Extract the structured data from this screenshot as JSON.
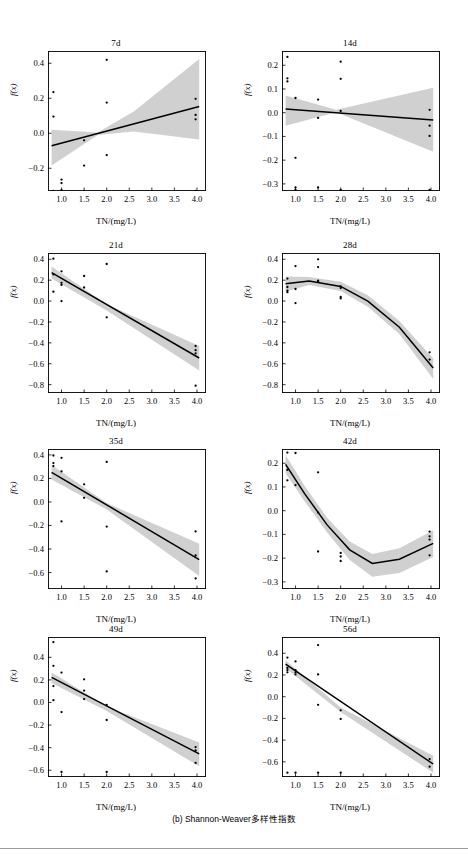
{
  "figure": {
    "caption": "(b) Shannon-Weaver多样性指数",
    "x_axis_label": "TN/(mg/L)",
    "y_axis_label": "f(x)"
  },
  "chart_data": [
    {
      "type": "scatter",
      "title": "7d",
      "xlabel": "TN/(mg/L)",
      "ylabel": "f(x)",
      "xlim": [
        0.7,
        4.2
      ],
      "ylim": [
        -0.33,
        0.47
      ],
      "xticks": [
        "1.0",
        "1.5",
        "2.0",
        "2.5",
        "3.0",
        "3.5",
        "4.0"
      ],
      "xtickvals": [
        1.0,
        1.5,
        2.0,
        2.5,
        3.0,
        3.5,
        4.0
      ],
      "yticks": [
        "0.4",
        "0.2",
        "0.0",
        "-0.2"
      ],
      "ytickvals": [
        0.4,
        0.2,
        0.0,
        -0.2
      ],
      "grid": false,
      "legend": "none",
      "points": [
        [
          0.82,
          0.235
        ],
        [
          0.82,
          0.095
        ],
        [
          0.82,
          -0.33
        ],
        [
          1.0,
          -0.265
        ],
        [
          1.0,
          -0.285
        ],
        [
          1.0,
          -0.325
        ],
        [
          1.0,
          -0.335
        ],
        [
          1.5,
          -0.04
        ],
        [
          1.5,
          -0.185
        ],
        [
          1.5,
          -0.33
        ],
        [
          2.0,
          0.42
        ],
        [
          2.0,
          0.175
        ],
        [
          2.0,
          -0.125
        ],
        [
          2.0,
          -0.33
        ],
        [
          3.97,
          0.197
        ],
        [
          3.97,
          0.105
        ],
        [
          3.97,
          0.08
        ],
        [
          3.97,
          -0.33
        ]
      ],
      "fit": [
        [
          0.78,
          -0.072
        ],
        [
          4.05,
          0.153
        ]
      ],
      "band_upper": [
        [
          0.78,
          0.02
        ],
        [
          1.8,
          0.005
        ],
        [
          2.6,
          0.125
        ],
        [
          4.05,
          0.425
        ]
      ],
      "band_lower": [
        [
          0.78,
          -0.185
        ],
        [
          1.8,
          -0.01
        ],
        [
          2.6,
          0.01
        ],
        [
          4.05,
          -0.035
        ]
      ]
    },
    {
      "type": "scatter",
      "title": "14d",
      "xlabel": "TN/(mg/L)",
      "ylabel": "f(x)",
      "xlim": [
        0.7,
        4.2
      ],
      "ylim": [
        -0.33,
        0.26
      ],
      "xticks": [
        "1.0",
        "1.5",
        "2.0",
        "2.5",
        "3.0",
        "3.5",
        "4.0"
      ],
      "xtickvals": [
        1.0,
        1.5,
        2.0,
        2.5,
        3.0,
        3.5,
        4.0
      ],
      "yticks": [
        "0.2",
        "0.1",
        "0.0",
        "-0.1",
        "-0.2",
        "-0.3"
      ],
      "ytickvals": [
        0.2,
        0.1,
        0.0,
        -0.1,
        -0.2,
        -0.3
      ],
      "grid": false,
      "legend": "none",
      "points": [
        [
          0.82,
          0.235
        ],
        [
          0.82,
          0.145
        ],
        [
          0.82,
          0.132
        ],
        [
          1.0,
          0.062
        ],
        [
          1.0,
          -0.19
        ],
        [
          1.0,
          -0.315
        ],
        [
          1.0,
          -0.325
        ],
        [
          1.5,
          0.055
        ],
        [
          1.5,
          -0.022
        ],
        [
          1.5,
          -0.315
        ],
        [
          2.0,
          0.215
        ],
        [
          2.0,
          0.143
        ],
        [
          2.0,
          0.007
        ],
        [
          2.0,
          -0.325
        ],
        [
          3.97,
          0.012
        ],
        [
          3.97,
          -0.055
        ],
        [
          3.97,
          -0.098
        ],
        [
          3.97,
          -0.325
        ]
      ],
      "fit": [
        [
          0.78,
          0.015
        ],
        [
          4.05,
          -0.031
        ]
      ],
      "band_upper": [
        [
          0.78,
          0.072
        ],
        [
          1.9,
          0.012
        ],
        [
          4.05,
          0.105
        ]
      ],
      "band_lower": [
        [
          0.78,
          -0.055
        ],
        [
          1.9,
          0.002
        ],
        [
          4.05,
          -0.165
        ]
      ]
    },
    {
      "type": "scatter",
      "title": "21d",
      "xlabel": "TN/(mg/L)",
      "ylabel": "f(x)",
      "xlim": [
        0.7,
        4.2
      ],
      "ylim": [
        -0.88,
        0.46
      ],
      "xticks": [
        "1.0",
        "1.5",
        "2.0",
        "2.5",
        "3.0",
        "3.5",
        "4.0"
      ],
      "xtickvals": [
        1.0,
        1.5,
        2.0,
        2.5,
        3.0,
        3.5,
        4.0
      ],
      "yticks": [
        "0.4",
        "0.2",
        "0.0",
        "-0.2",
        "-0.4",
        "-0.6",
        "-0.8"
      ],
      "ytickvals": [
        0.4,
        0.2,
        0.0,
        -0.2,
        -0.4,
        -0.6,
        -0.8
      ],
      "grid": false,
      "legend": "none",
      "points": [
        [
          0.82,
          0.405
        ],
        [
          0.82,
          0.255
        ],
        [
          0.82,
          0.09
        ],
        [
          1.0,
          0.285
        ],
        [
          1.0,
          0.175
        ],
        [
          1.0,
          0.155
        ],
        [
          1.0,
          0.0
        ],
        [
          1.5,
          0.24
        ],
        [
          1.5,
          0.13
        ],
        [
          2.0,
          0.355
        ],
        [
          2.0,
          -0.155
        ],
        [
          3.97,
          -0.43
        ],
        [
          3.97,
          -0.47
        ],
        [
          3.97,
          -0.5
        ],
        [
          3.97,
          -0.81
        ]
      ],
      "fit": [
        [
          0.78,
          0.272
        ],
        [
          4.05,
          -0.545
        ]
      ],
      "band_upper": [
        [
          0.78,
          0.33
        ],
        [
          2.0,
          -0.03
        ],
        [
          4.05,
          -0.43
        ]
      ],
      "band_lower": [
        [
          0.78,
          0.215
        ],
        [
          2.0,
          -0.09
        ],
        [
          4.05,
          -0.665
        ]
      ]
    },
    {
      "type": "scatter",
      "title": "28d",
      "xlabel": "TN/(mg/L)",
      "ylabel": "f(x)",
      "xlim": [
        0.7,
        4.2
      ],
      "ylim": [
        -0.88,
        0.46
      ],
      "xticks": [
        "1.0",
        "1.5",
        "2.0",
        "2.5",
        "3.0",
        "3.5",
        "4.0"
      ],
      "xtickvals": [
        1.0,
        1.5,
        2.0,
        2.5,
        3.0,
        3.5,
        4.0
      ],
      "yticks": [
        "0.4",
        "0.2",
        "0.0",
        "-0.2",
        "-0.4",
        "-0.6",
        "-0.8"
      ],
      "ytickvals": [
        0.4,
        0.2,
        0.0,
        -0.2,
        -0.4,
        -0.6,
        -0.8
      ],
      "grid": false,
      "legend": "none",
      "points": [
        [
          0.82,
          0.215
        ],
        [
          0.82,
          0.135
        ],
        [
          0.82,
          0.1
        ],
        [
          0.82,
          0.085
        ],
        [
          1.0,
          0.335
        ],
        [
          1.0,
          0.115
        ],
        [
          1.0,
          -0.02
        ],
        [
          1.5,
          0.4
        ],
        [
          1.5,
          0.325
        ],
        [
          1.5,
          0.195
        ],
        [
          1.5,
          0.185
        ],
        [
          2.0,
          0.14
        ],
        [
          2.0,
          0.125
        ],
        [
          2.0,
          0.04
        ],
        [
          2.0,
          0.025
        ],
        [
          3.97,
          -0.49
        ],
        [
          3.97,
          -0.56
        ]
      ],
      "fit": [
        [
          0.78,
          0.165
        ],
        [
          1.3,
          0.192
        ],
        [
          2.0,
          0.14
        ],
        [
          2.6,
          0.0
        ],
        [
          3.3,
          -0.25
        ],
        [
          4.05,
          -0.64
        ]
      ],
      "band_upper": [
        [
          0.78,
          0.235
        ],
        [
          1.3,
          0.23
        ],
        [
          2.0,
          0.185
        ],
        [
          2.6,
          0.055
        ],
        [
          3.3,
          -0.19
        ],
        [
          4.05,
          -0.55
        ]
      ],
      "band_lower": [
        [
          0.78,
          0.09
        ],
        [
          1.3,
          0.155
        ],
        [
          2.0,
          0.095
        ],
        [
          2.6,
          -0.055
        ],
        [
          3.3,
          -0.315
        ],
        [
          4.05,
          -0.745
        ]
      ]
    },
    {
      "type": "scatter",
      "title": "35d",
      "xlabel": "TN/(mg/L)",
      "ylabel": "f(x)",
      "xlim": [
        0.7,
        4.2
      ],
      "ylim": [
        -0.74,
        0.45
      ],
      "xticks": [
        "1.0",
        "1.5",
        "2.0",
        "2.5",
        "3.0",
        "3.5",
        "4.0"
      ],
      "xtickvals": [
        1.0,
        1.5,
        2.0,
        2.5,
        3.0,
        3.5,
        4.0
      ],
      "yticks": [
        "0.4",
        "0.2",
        "0.0",
        "-0.2",
        "-0.4",
        "-0.6"
      ],
      "ytickvals": [
        0.4,
        0.2,
        0.0,
        -0.2,
        -0.4,
        -0.6
      ],
      "grid": false,
      "legend": "none",
      "points": [
        [
          0.82,
          0.395
        ],
        [
          0.82,
          0.33
        ],
        [
          0.82,
          0.305
        ],
        [
          1.0,
          0.375
        ],
        [
          1.0,
          0.26
        ],
        [
          1.0,
          -0.165
        ],
        [
          1.5,
          0.15
        ],
        [
          1.5,
          0.035
        ],
        [
          2.0,
          0.34
        ],
        [
          2.0,
          -0.21
        ],
        [
          2.0,
          -0.59
        ],
        [
          3.97,
          -0.25
        ],
        [
          3.97,
          -0.455
        ],
        [
          3.97,
          -0.65
        ]
      ],
      "fit": [
        [
          0.78,
          0.252
        ],
        [
          4.05,
          -0.49
        ]
      ],
      "band_upper": [
        [
          0.78,
          0.315
        ],
        [
          2.0,
          -0.01
        ],
        [
          4.05,
          -0.355
        ]
      ],
      "band_lower": [
        [
          0.78,
          0.19
        ],
        [
          2.0,
          -0.065
        ],
        [
          4.05,
          -0.63
        ]
      ]
    },
    {
      "type": "scatter",
      "title": "42d",
      "xlabel": "TN/(mg/L)",
      "ylabel": "f(x)",
      "xlim": [
        0.7,
        4.2
      ],
      "ylim": [
        -0.33,
        0.26
      ],
      "xticks": [
        "1.0",
        "1.5",
        "2.0",
        "2.5",
        "3.0",
        "3.5",
        "4.0"
      ],
      "xtickvals": [
        1.0,
        1.5,
        2.0,
        2.5,
        3.0,
        3.5,
        4.0
      ],
      "yticks": [
        "0.2",
        "0.1",
        "0.0",
        "-0.1",
        "-0.2",
        "-0.3"
      ],
      "ytickvals": [
        0.2,
        0.1,
        0.0,
        -0.1,
        -0.2,
        -0.3
      ],
      "grid": false,
      "legend": "none",
      "points": [
        [
          0.82,
          0.245
        ],
        [
          0.82,
          0.172
        ],
        [
          0.82,
          0.128
        ],
        [
          1.0,
          0.243
        ],
        [
          1.0,
          0.108
        ],
        [
          1.5,
          0.162
        ],
        [
          1.5,
          -0.008
        ],
        [
          1.5,
          -0.172
        ],
        [
          2.0,
          -0.178
        ],
        [
          2.0,
          -0.193
        ],
        [
          2.0,
          -0.212
        ],
        [
          3.97,
          -0.088
        ],
        [
          3.97,
          -0.108
        ],
        [
          3.97,
          -0.122
        ],
        [
          3.97,
          -0.188
        ]
      ],
      "fit": [
        [
          0.78,
          0.195
        ],
        [
          1.2,
          0.072
        ],
        [
          1.7,
          -0.06
        ],
        [
          2.2,
          -0.165
        ],
        [
          2.7,
          -0.222
        ],
        [
          3.3,
          -0.205
        ],
        [
          4.05,
          -0.138
        ]
      ],
      "band_upper": [
        [
          0.78,
          0.235
        ],
        [
          1.2,
          0.105
        ],
        [
          1.7,
          -0.03
        ],
        [
          2.2,
          -0.13
        ],
        [
          2.7,
          -0.182
        ],
        [
          3.3,
          -0.158
        ],
        [
          4.05,
          -0.082
        ]
      ],
      "band_lower": [
        [
          0.78,
          0.158
        ],
        [
          1.2,
          0.04
        ],
        [
          1.7,
          -0.092
        ],
        [
          2.2,
          -0.208
        ],
        [
          2.7,
          -0.278
        ],
        [
          3.3,
          -0.262
        ],
        [
          4.05,
          -0.195
        ]
      ]
    },
    {
      "type": "scatter",
      "title": "49d",
      "xlabel": "TN/(mg/L)",
      "ylabel": "f(x)",
      "xlim": [
        0.7,
        4.2
      ],
      "ylim": [
        -0.66,
        0.58
      ],
      "xticks": [
        "1.0",
        "1.5",
        "2.0",
        "2.5",
        "3.0",
        "3.5",
        "4.0"
      ],
      "xtickvals": [
        1.0,
        1.5,
        2.0,
        2.5,
        3.0,
        3.5,
        4.0
      ],
      "yticks": [
        "0.4",
        "0.2",
        "0.0",
        "-0.2",
        "-0.4",
        "-0.6"
      ],
      "ytickvals": [
        0.4,
        0.2,
        0.0,
        -0.2,
        -0.4,
        -0.6
      ],
      "grid": false,
      "legend": "none",
      "points": [
        [
          0.82,
          0.535
        ],
        [
          0.82,
          0.325
        ],
        [
          0.82,
          0.145
        ],
        [
          0.82,
          0.02
        ],
        [
          1.0,
          0.265
        ],
        [
          1.0,
          -0.085
        ],
        [
          1.0,
          -0.615
        ],
        [
          1.5,
          0.205
        ],
        [
          1.5,
          0.105
        ],
        [
          1.5,
          0.03
        ],
        [
          2.0,
          -0.022
        ],
        [
          2.0,
          -0.155
        ],
        [
          2.0,
          -0.615
        ],
        [
          3.97,
          -0.395
        ],
        [
          3.97,
          -0.425
        ],
        [
          3.97,
          -0.535
        ]
      ],
      "fit": [
        [
          0.78,
          0.222
        ],
        [
          4.05,
          -0.455
        ]
      ],
      "band_upper": [
        [
          0.78,
          0.268
        ],
        [
          2.0,
          -0.035
        ],
        [
          4.05,
          -0.355
        ]
      ],
      "band_lower": [
        [
          0.78,
          0.172
        ],
        [
          2.0,
          -0.075
        ],
        [
          4.05,
          -0.565
        ]
      ]
    },
    {
      "type": "scatter",
      "title": "56d",
      "xlabel": "TN/(mg/L)",
      "ylabel": "f(x)",
      "xlim": [
        0.7,
        4.2
      ],
      "ylim": [
        -0.74,
        0.55
      ],
      "xticks": [
        "1.0",
        "1.5",
        "2.0",
        "2.5",
        "3.0",
        "3.5",
        "4.0"
      ],
      "xtickvals": [
        1.0,
        1.5,
        2.0,
        2.5,
        3.0,
        3.5,
        4.0
      ],
      "yticks": [
        "0.4",
        "0.2",
        "0.0",
        "-0.2",
        "-0.4",
        "-0.6"
      ],
      "ytickvals": [
        0.4,
        0.2,
        0.0,
        -0.2,
        -0.4,
        -0.6
      ],
      "grid": false,
      "legend": "none",
      "points": [
        [
          0.82,
          0.36
        ],
        [
          0.82,
          0.265
        ],
        [
          0.82,
          0.245
        ],
        [
          0.82,
          0.225
        ],
        [
          0.82,
          -0.7
        ],
        [
          1.0,
          0.325
        ],
        [
          1.0,
          0.245
        ],
        [
          1.0,
          0.225
        ],
        [
          1.0,
          0.205
        ],
        [
          1.0,
          -0.7
        ],
        [
          1.5,
          0.475
        ],
        [
          1.5,
          0.205
        ],
        [
          1.5,
          -0.075
        ],
        [
          1.5,
          -0.7
        ],
        [
          2.0,
          -0.125
        ],
        [
          2.0,
          -0.205
        ],
        [
          2.0,
          -0.7
        ],
        [
          3.97,
          -0.575
        ],
        [
          3.97,
          -0.645
        ]
      ],
      "fit": [
        [
          0.78,
          0.3
        ],
        [
          4.05,
          -0.62
        ]
      ],
      "band_upper": [
        [
          0.78,
          0.335
        ],
        [
          2.0,
          -0.1
        ],
        [
          4.05,
          -0.545
        ]
      ],
      "band_lower": [
        [
          0.78,
          0.262
        ],
        [
          2.0,
          -0.142
        ],
        [
          4.05,
          -0.7
        ]
      ]
    }
  ]
}
